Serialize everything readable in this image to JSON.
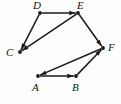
{
  "diagram": {
    "type": "directed-graph",
    "background_color": "#fefefe",
    "stroke_color": "#1a1a1a",
    "label_color": "#111111",
    "width": 121,
    "height": 104,
    "vertices": [
      {
        "id": "A",
        "label": "A",
        "x": 38,
        "y": 76,
        "label_x": 32,
        "label_y": 82
      },
      {
        "id": "B",
        "label": "B",
        "x": 76,
        "y": 76,
        "label_x": 72,
        "label_y": 82
      },
      {
        "id": "C",
        "label": "C",
        "x": 20,
        "y": 52,
        "label_x": 6,
        "label_y": 47
      },
      {
        "id": "D",
        "label": "D",
        "x": 40,
        "y": 13,
        "label_x": 33,
        "label_y": 0
      },
      {
        "id": "E",
        "label": "E",
        "x": 78,
        "y": 13,
        "label_x": 77,
        "label_y": 0
      },
      {
        "id": "F",
        "label": "F",
        "x": 103,
        "y": 48,
        "label_x": 108,
        "label_y": 42
      }
    ],
    "edges": [
      {
        "id": "D-E",
        "from": "D",
        "to": "E",
        "directed": true
      },
      {
        "id": "D-C",
        "from": "D",
        "to": "C",
        "directed": true
      },
      {
        "id": "E-C",
        "from": "E",
        "to": "C",
        "directed": true
      },
      {
        "id": "E-F",
        "from": "E",
        "to": "F",
        "directed": true
      },
      {
        "id": "A-B",
        "from": "A",
        "to": "B",
        "directed": true
      },
      {
        "id": "B-F",
        "from": "B",
        "to": "F",
        "directed": true
      },
      {
        "id": "F-A",
        "from": "F",
        "to": "A",
        "directed": true
      }
    ]
  }
}
